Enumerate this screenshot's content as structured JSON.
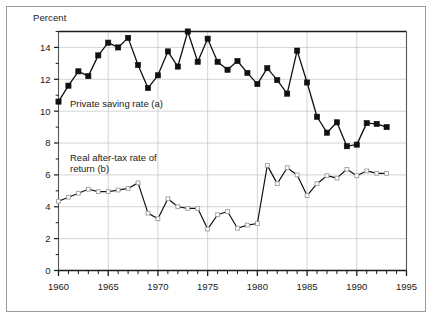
{
  "figure": {
    "axis_title": "Percent",
    "series_label_a": "Private saving rate (a)",
    "series_label_b_line1": "Real after-tax rate of",
    "series_label_b_line2": "return (b)"
  },
  "chart_data": {
    "type": "line",
    "title": "",
    "subtitle": "",
    "xlabel": "",
    "ylabel": "Percent",
    "ylim": [
      0,
      15
    ],
    "xlim": [
      1960,
      1995
    ],
    "grid": true,
    "legend_position": "inline-annotation",
    "y_ticks": [
      0,
      2,
      4,
      6,
      8,
      10,
      12,
      14
    ],
    "y_tick_labels": [
      "0",
      "2",
      "4",
      "6",
      "8",
      "10",
      "12",
      "14"
    ],
    "y_minor_tick_step": 1,
    "x_ticks": [
      1960,
      1965,
      1970,
      1975,
      1980,
      1985,
      1990,
      1995
    ],
    "x_tick_labels": [
      "1960",
      "1965",
      "1970",
      "1975",
      "1980",
      "1985",
      "1990",
      "1995"
    ],
    "x_minor_tick_step": 1,
    "x": [
      1960,
      1961,
      1962,
      1963,
      1964,
      1965,
      1966,
      1967,
      1968,
      1969,
      1970,
      1971,
      1972,
      1973,
      1974,
      1975,
      1976,
      1977,
      1978,
      1979,
      1980,
      1981,
      1982,
      1983,
      1984,
      1985,
      1986,
      1987,
      1988,
      1989,
      1990,
      1991,
      1992,
      1993
    ],
    "series": [
      {
        "name": "Private saving rate (a)",
        "marker": "filled-square",
        "color": "#111111",
        "values": [
          10.6,
          11.6,
          12.5,
          12.2,
          13.5,
          14.3,
          14.0,
          14.6,
          12.9,
          11.45,
          12.25,
          13.75,
          12.8,
          15.0,
          13.1,
          14.55,
          13.1,
          12.6,
          13.15,
          12.4,
          11.7,
          12.7,
          11.95,
          11.1,
          13.8,
          11.8,
          9.65,
          8.65,
          9.3,
          7.8,
          7.9,
          9.25,
          9.2,
          9.0
        ]
      },
      {
        "name": "Real after-tax rate of return (b)",
        "marker": "open-square",
        "color": "#111111",
        "values": [
          4.35,
          4.6,
          4.85,
          5.1,
          4.95,
          4.95,
          5.05,
          5.15,
          5.5,
          3.6,
          3.25,
          4.5,
          4.0,
          3.9,
          3.9,
          2.6,
          3.5,
          3.7,
          2.65,
          2.85,
          2.95,
          6.6,
          5.45,
          6.45,
          6.0,
          4.7,
          5.45,
          5.95,
          5.8,
          6.35,
          5.95,
          6.25,
          6.1,
          6.1
        ]
      }
    ]
  }
}
